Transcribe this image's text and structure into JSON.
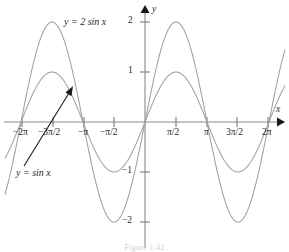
{
  "figure": {
    "caption": "Figure 1.42",
    "axis_labels": {
      "x": "x",
      "y": "y"
    },
    "colors": {
      "axis": "#8a8a8a",
      "curve": "#a0a0a0",
      "annotation": "#2a2a2a",
      "background": "#ffffff"
    }
  },
  "annotations": {
    "curve_label_2sin": "y = 2 sin x",
    "curve_label_sin": "y = sin x",
    "arrow": {
      "name": "pointer-arrow",
      "from_x": 24,
      "from_y": 166,
      "to_x": 73,
      "to_y": 87
    }
  },
  "x_ticks": [
    {
      "label": "−2π",
      "value": -6.2832,
      "px": 22
    },
    {
      "label": "−3π/2",
      "value": -4.7124,
      "px": 53
    },
    {
      "label": "−π",
      "value": -3.1416,
      "px": 84
    },
    {
      "label": "−π/2",
      "value": -1.5708,
      "px": 114
    },
    {
      "label": "π/2",
      "value": 1.5708,
      "px": 176
    },
    {
      "label": "π",
      "value": 3.1416,
      "px": 207
    },
    {
      "label": "3π/2",
      "value": 4.7124,
      "px": 237
    },
    {
      "label": "2π",
      "value": 6.2832,
      "px": 268
    }
  ],
  "y_ticks": [
    {
      "label": "2",
      "value": 2,
      "px": 22
    },
    {
      "label": "1",
      "value": 1,
      "px": 72
    },
    {
      "label": "−1",
      "value": -1,
      "px": 172
    },
    {
      "label": "−2",
      "value": -2,
      "px": 222
    }
  ],
  "chart_data": {
    "type": "line",
    "title": "",
    "xlabel": "x",
    "ylabel": "y",
    "xlim": [
      -7.1,
      7.1
    ],
    "ylim": [
      -2.45,
      2.45
    ],
    "grid": false,
    "legend": "inline-labels",
    "xtick_labels": [
      "−2π",
      "−3π/2",
      "−π",
      "−π/2",
      "π/2",
      "π",
      "3π/2",
      "2π"
    ],
    "xtick_values": [
      -6.2832,
      -4.7124,
      -3.1416,
      -1.5708,
      1.5708,
      3.1416,
      4.7124,
      6.2832
    ],
    "ytick_labels": [
      "2",
      "1",
      "−1",
      "−2"
    ],
    "ytick_values": [
      2,
      1,
      -1,
      -2
    ],
    "series": [
      {
        "name": "y = 2 sin x",
        "formula": "2*sin(x)",
        "amplitude": 2,
        "period": 6.2832,
        "color": "#a0a0a0",
        "key_points": [
          {
            "x": -6.2832,
            "y": 0
          },
          {
            "x": -4.7124,
            "y": 2
          },
          {
            "x": -3.1416,
            "y": 0
          },
          {
            "x": -1.5708,
            "y": -2
          },
          {
            "x": 0,
            "y": 0
          },
          {
            "x": 1.5708,
            "y": 2
          },
          {
            "x": 3.1416,
            "y": 0
          },
          {
            "x": 4.7124,
            "y": -2
          },
          {
            "x": 6.2832,
            "y": 0
          }
        ]
      },
      {
        "name": "y = sin x",
        "formula": "sin(x)",
        "amplitude": 1,
        "period": 6.2832,
        "color": "#a0a0a0",
        "key_points": [
          {
            "x": -6.2832,
            "y": 0
          },
          {
            "x": -4.7124,
            "y": 1
          },
          {
            "x": -3.1416,
            "y": 0
          },
          {
            "x": -1.5708,
            "y": -1
          },
          {
            "x": 0,
            "y": 0
          },
          {
            "x": 1.5708,
            "y": 1
          },
          {
            "x": 3.1416,
            "y": 0
          },
          {
            "x": 4.7124,
            "y": -1
          },
          {
            "x": 6.2832,
            "y": 0
          }
        ]
      }
    ]
  }
}
